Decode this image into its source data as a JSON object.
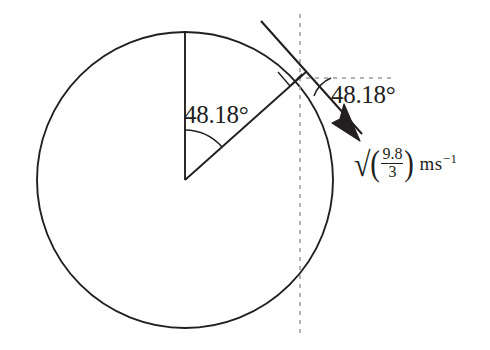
{
  "figure": {
    "background_color": "#ffffff",
    "stroke_color": "#231f20",
    "dash_color": "#8a8a8a"
  },
  "labels": {
    "center_angle": "48.18°",
    "tangent_angle": "48.18°",
    "speed": {
      "radical": "√",
      "open_paren": "(",
      "numerator": "9.8",
      "denominator": "3",
      "close_paren": ")",
      "units_mass": "m",
      "units_second": "s",
      "units_exponent": "−1",
      "full_text": "√(9.8/3) m s⁻¹"
    }
  },
  "geometry": {
    "circle": {
      "cx": 185,
      "cy": 180,
      "r": 148
    },
    "center_point": {
      "x": 185,
      "y": 180
    },
    "top_point": {
      "x": 185,
      "y": 32
    },
    "tangent_point": {
      "x": 295,
      "y": 81
    },
    "vertical_dashed_line_x": 300,
    "horizontal_dashed_line_y": 78,
    "horizontal_dashed_line_x_end": 392,
    "arrow_tip": {
      "x": 358,
      "y": 140
    },
    "tangent_line_start": {
      "x": 261,
      "y": 21
    },
    "angle_value_degrees": 48.18
  }
}
